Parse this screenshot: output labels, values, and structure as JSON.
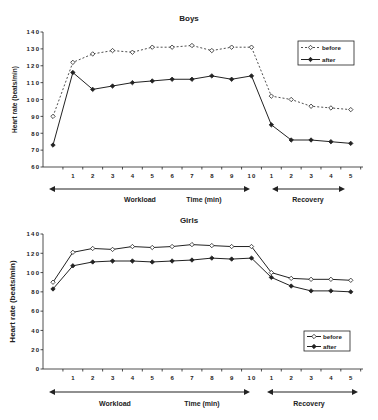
{
  "chart_data": [
    {
      "type": "line",
      "title": "Boys",
      "xlabel": "Time (min)",
      "ylabel": "Heart rate (beats/min)",
      "ylim": [
        60,
        140
      ],
      "yticks": [
        60,
        70,
        80,
        90,
        100,
        110,
        120,
        130,
        140
      ],
      "categories": [
        "0",
        "1",
        "2",
        "3",
        "4",
        "5",
        "6",
        "7",
        "8",
        "9",
        "10",
        "R1",
        "R2",
        "R3",
        "R4",
        "R5"
      ],
      "xtick_labels": [
        "",
        "1",
        "2",
        "3",
        "4",
        "5",
        "6",
        "7",
        "8",
        "9",
        "10",
        "1",
        "2",
        "3",
        "4",
        "5"
      ],
      "phases": [
        {
          "label": "Workload",
          "from": 0,
          "to": 10
        },
        {
          "label": "Recovery",
          "from": 11,
          "to": 15
        }
      ],
      "series": [
        {
          "name": "before",
          "style": "dashed",
          "marker": "open-diamond",
          "values": [
            90,
            122,
            127,
            129,
            128,
            131,
            131,
            132,
            129,
            131,
            131,
            102,
            100,
            96,
            95,
            94
          ]
        },
        {
          "name": "after",
          "style": "solid",
          "marker": "filled-diamond",
          "values": [
            73,
            116,
            106,
            108,
            110,
            111,
            112,
            112,
            114,
            112,
            114,
            85,
            76,
            76,
            75,
            74
          ]
        }
      ],
      "legend_position": "top-right",
      "grid": false
    },
    {
      "type": "line",
      "title": "Girls",
      "xlabel": "Time (min)",
      "ylabel": "Heart rate (beats/min)",
      "ylim": [
        0,
        140
      ],
      "yticks": [
        0,
        20,
        40,
        60,
        80,
        100,
        120,
        140
      ],
      "categories": [
        "0",
        "1",
        "2",
        "3",
        "4",
        "5",
        "6",
        "7",
        "8",
        "9",
        "10",
        "R1",
        "R2",
        "R3",
        "R4",
        "R5"
      ],
      "xtick_labels": [
        "",
        "1",
        "2",
        "3",
        "4",
        "5",
        "6",
        "7",
        "8",
        "9",
        "10",
        "1",
        "2",
        "3",
        "4",
        "5"
      ],
      "phases": [
        {
          "label": "Workload",
          "from": 0,
          "to": 10
        },
        {
          "label": "Recovery",
          "from": 11,
          "to": 15
        }
      ],
      "series": [
        {
          "name": "before",
          "style": "solid",
          "marker": "open-diamond",
          "values": [
            90,
            121,
            125,
            124,
            127,
            126,
            127,
            129,
            128,
            127,
            127,
            100,
            94,
            93,
            93,
            92
          ]
        },
        {
          "name": "after",
          "style": "solid",
          "marker": "filled-diamond",
          "values": [
            83,
            107,
            111,
            112,
            112,
            111,
            112,
            113,
            115,
            114,
            115,
            95,
            86,
            81,
            81,
            80
          ]
        }
      ],
      "legend_position": "bottom-right",
      "grid": false
    }
  ],
  "labels": {
    "workload": "Workload",
    "recovery": "Recovery",
    "time": "Time (min)"
  },
  "colors": {
    "line": "#222222",
    "background": "#ffffff"
  }
}
